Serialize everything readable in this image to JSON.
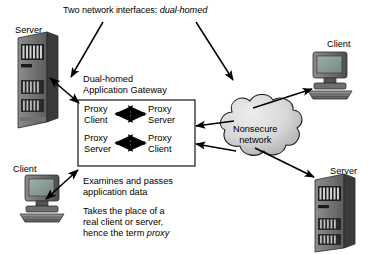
{
  "diagram": {
    "title": {
      "prefix": "Two network interfaces: ",
      "emphasis": "dual-homed"
    },
    "gateway": {
      "caption_line1": "Dual-homed",
      "caption_line2": "Application Gateway",
      "rows": [
        {
          "left_line1": "Proxy",
          "left_line2": "Client",
          "right_line1": "Proxy",
          "right_line2": "Server"
        },
        {
          "left_line1": "Proxy",
          "left_line2": "Server",
          "right_line1": "Proxy",
          "right_line2": "Client"
        }
      ]
    },
    "cloud": {
      "line1": "Nonsecure",
      "line2": "network"
    },
    "nodes": {
      "server_top_left": "Server",
      "client_bottom_left": "Client",
      "client_top_right": "Client",
      "server_bottom_right": "Server"
    },
    "notes": {
      "note1_line1": "Examines and passes",
      "note1_line2": "application data",
      "note2_line1": "Takes the place of a",
      "note2_line2": "real client or server,",
      "note2_line3_prefix": "hence the term ",
      "note2_line3_emphasis": "proxy"
    },
    "colors": {
      "ink": "#000000",
      "background": "#ffffff",
      "cloud_fill_light": "#e2e2e2",
      "cloud_fill_dark": "#a8a8a8",
      "cloud_outline": "#1a1a1a",
      "device_dark": "#4a4a4a",
      "device_mid": "#6e6e6e",
      "device_light": "#9a9a9a",
      "screen": "#8c9a96"
    }
  }
}
